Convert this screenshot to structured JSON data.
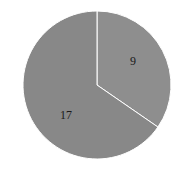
{
  "chart_data": {
    "type": "pie",
    "title": "",
    "categories": [
      "A",
      "B"
    ],
    "values": [
      9,
      17
    ],
    "labels": [
      "9",
      "17"
    ],
    "colors": [
      "#8e8e8e",
      "#888888"
    ],
    "start_angle_deg": 90,
    "direction": "clockwise",
    "legend": "none"
  }
}
